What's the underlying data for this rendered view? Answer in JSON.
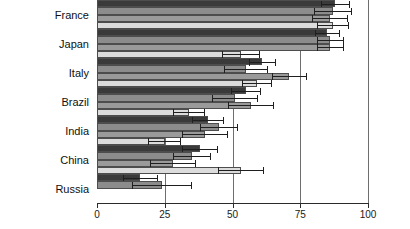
{
  "chart_data": {
    "type": "bar",
    "orientation": "horizontal",
    "title": "",
    "subtitle": "",
    "xlabel": "",
    "ylabel": "",
    "xlim": [
      0,
      100
    ],
    "ylim": null,
    "xticks": [
      0,
      25,
      50,
      75,
      100
    ],
    "xtick_labels": [
      "0",
      "25",
      "50",
      "75",
      "100"
    ],
    "grid": "vertical",
    "legend": null,
    "legend_position": "none",
    "note": "Grouped horizontal bar chart with 4 bars per country and horizontal error bars. Top of figure is cropped so the first France bar is partially cut off.",
    "categories": [
      "France",
      "Japan",
      "Italy",
      "Brazil",
      "India",
      "China",
      "Russia"
    ],
    "series": [
      {
        "name": "Series 1",
        "color": "#3a3a3a",
        "values": [
          88,
          85,
          61,
          55,
          41,
          38,
          16
        ],
        "errors": [
          5.5,
          4.5,
          5.0,
          5.5,
          6.0,
          6.5,
          6.5
        ]
      },
      {
        "name": "Series 2",
        "color": "#8c8c8c",
        "values": [
          87,
          86,
          55,
          51,
          45,
          35,
          24
        ],
        "errors": [
          7.0,
          5.0,
          8.0,
          8.5,
          7.0,
          7.0,
          11.0
        ]
      },
      {
        "name": "Series 3",
        "color": "#9a9a9a",
        "values": [
          86,
          86,
          71,
          57,
          40,
          28,
          0
        ],
        "errors": [
          6.5,
          5.0,
          6.5,
          8.5,
          8.5,
          8.5,
          0
        ]
      },
      {
        "name": "Series 4",
        "color": "#dcdcdc",
        "values": [
          87,
          53,
          59,
          34,
          25,
          53,
          0
        ],
        "errors": [
          6.0,
          7.0,
          5.5,
          6.0,
          6.0,
          8.5,
          0
        ]
      }
    ],
    "colors": {
      "bar_series_1": "#3a3a3a",
      "bar_series_2": "#8c8c8c",
      "bar_series_3": "#9a9a9a",
      "bar_series_4": "#dcdcdc",
      "bar_outline": "#4d4d4d",
      "error_bar": "#1f1f1f",
      "gridline": "#6e6e6e",
      "axis": "#2b2b2b",
      "background": "#ffffff",
      "text": "#101010"
    }
  }
}
